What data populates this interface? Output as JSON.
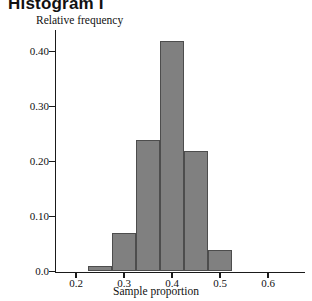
{
  "title": "Histogram I",
  "chart_data": {
    "type": "bar",
    "title": "Histogram I",
    "xlabel": "Sample proportion",
    "ylabel": "Relative frequency",
    "xlim": [
      0.175,
      0.655
    ],
    "ylim": [
      0.0,
      0.45
    ],
    "grid": false,
    "legend": null,
    "bin_width": 0.05,
    "categories": [
      "0.225",
      "0.275",
      "0.325",
      "0.375",
      "0.425",
      "0.475"
    ],
    "bin_edges": [
      0.2,
      0.25,
      0.3,
      0.35,
      0.4,
      0.45,
      0.5
    ],
    "values": [
      0.01,
      0.07,
      0.24,
      0.42,
      0.22,
      0.04
    ],
    "xticks": [
      "0.2",
      "0.3",
      "0.4",
      "0.5",
      "0.6"
    ],
    "xtick_values": [
      0.2,
      0.3,
      0.4,
      0.5,
      0.6
    ],
    "yticks": [
      "0.0",
      "0.10",
      "0.20",
      "0.30",
      "0.40"
    ],
    "ytick_values": [
      0.0,
      0.1,
      0.2,
      0.3,
      0.4
    ],
    "bar_color": "#808080",
    "bar_edge_color": "#4d4d4d",
    "axis_color": "#1a1a1a"
  }
}
